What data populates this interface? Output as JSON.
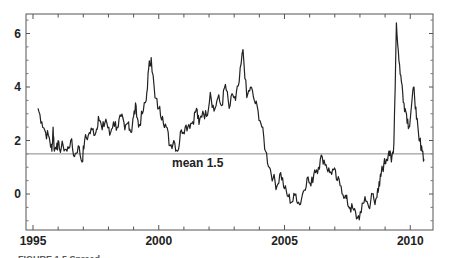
{
  "chart_data": {
    "type": "line",
    "title": "",
    "xlabel": "",
    "ylabel": "",
    "xlim": [
      1994.95,
      2010.95
    ],
    "ylim": [
      -1.4,
      6.7
    ],
    "grid": false,
    "legend": null,
    "x_ticks": [
      1995,
      2000,
      2005,
      2010
    ],
    "x_tick_labels": [
      "1995",
      "2000",
      "2005",
      "2010"
    ],
    "y_ticks": [
      0,
      2,
      4,
      6
    ],
    "y_tick_labels": [
      "0",
      "2",
      "4",
      "6"
    ],
    "reference_line": {
      "y": 1.5,
      "label": "mean 1.5"
    },
    "series": [
      {
        "name": "series",
        "x": [
          1995.2,
          1995.35,
          1995.5,
          1995.65,
          1995.75,
          1995.8,
          1995.85,
          1995.95,
          1996.05,
          1996.2,
          1996.35,
          1996.5,
          1996.65,
          1996.8,
          1996.95,
          1997.05,
          1997.2,
          1997.35,
          1997.5,
          1997.6,
          1997.75,
          1997.9,
          1998.05,
          1998.2,
          1998.35,
          1998.5,
          1998.65,
          1998.8,
          1998.9,
          1999.0,
          1999.1,
          1999.2,
          1999.35,
          1999.5,
          1999.6,
          1999.7,
          1999.85,
          2000.0,
          2000.15,
          2000.3,
          2000.45,
          2000.6,
          2000.75,
          2000.9,
          2001.05,
          2001.2,
          2001.35,
          2001.5,
          2001.6,
          2001.75,
          2001.9,
          2002.05,
          2002.2,
          2002.35,
          2002.5,
          2002.65,
          2002.8,
          2002.95,
          2003.05,
          2003.2,
          2003.35,
          2003.5,
          2003.65,
          2003.8,
          2003.95,
          2004.1,
          2004.25,
          2004.4,
          2004.55,
          2004.7,
          2004.85,
          2005.0,
          2005.15,
          2005.3,
          2005.45,
          2005.6,
          2005.75,
          2005.9,
          2006.05,
          2006.2,
          2006.35,
          2006.5,
          2006.65,
          2006.8,
          2006.95,
          2007.1,
          2007.25,
          2007.4,
          2007.5,
          2007.6,
          2007.75,
          2007.9,
          2008.05,
          2008.2,
          2008.35,
          2008.5,
          2008.6,
          2008.7,
          2008.78,
          2008.85,
          2008.95,
          2009.05,
          2009.15,
          2009.25,
          2009.35,
          2009.45,
          2009.55,
          2009.65,
          2009.75,
          2009.85,
          2009.95,
          2010.05,
          2010.15,
          2010.25,
          2010.35,
          2010.45,
          2010.55
        ],
        "y": [
          3.2,
          2.7,
          2.3,
          2.1,
          1.6,
          2.5,
          1.6,
          1.9,
          1.7,
          1.8,
          1.6,
          2.0,
          1.4,
          1.8,
          1.2,
          2.0,
          2.2,
          2.4,
          2.3,
          2.9,
          2.4,
          2.8,
          2.2,
          2.7,
          2.5,
          2.9,
          2.4,
          2.7,
          2.3,
          2.9,
          3.3,
          2.5,
          3.0,
          3.5,
          4.7,
          5.1,
          3.6,
          3.2,
          2.9,
          2.5,
          1.8,
          2.0,
          1.6,
          2.4,
          2.5,
          2.6,
          2.7,
          3.2,
          2.6,
          3.1,
          2.9,
          3.8,
          3.1,
          3.6,
          3.3,
          4.1,
          3.2,
          3.7,
          3.5,
          4.2,
          5.4,
          3.6,
          4.0,
          3.5,
          3.1,
          2.5,
          1.6,
          1.0,
          0.6,
          0.3,
          0.8,
          0.2,
          -0.1,
          -0.3,
          0.0,
          -0.4,
          0.1,
          0.6,
          0.3,
          0.9,
          1.0,
          1.4,
          1.1,
          0.8,
          0.9,
          0.5,
          0.3,
          -0.1,
          -0.3,
          -0.5,
          -0.6,
          -0.9,
          -0.7,
          -0.1,
          -0.5,
          0.0,
          -0.4,
          0.2,
          0.3,
          0.8,
          1.1,
          1.3,
          1.6,
          1.2,
          1.9,
          6.4,
          5.0,
          4.2,
          3.4,
          3.0,
          2.5,
          3.3,
          4.0,
          2.8,
          2.0,
          1.8,
          1.3
        ],
        "color": "#222222"
      }
    ]
  },
  "caption": "FIGURE 1.5  Spread ..."
}
